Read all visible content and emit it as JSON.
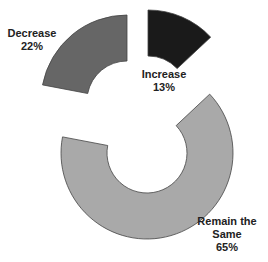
{
  "chart_data": {
    "type": "pie",
    "subtype": "exploded-donut",
    "title": "",
    "categories": [
      "Increase",
      "Remain the Same",
      "Decrease"
    ],
    "values": [
      13,
      65,
      22
    ],
    "unit": "%",
    "colors": [
      "#1a1a1a",
      "#a9a9a9",
      "#666666"
    ],
    "legend": "none (direct labels)",
    "labels": [
      {
        "name": "Increase",
        "value": "13%"
      },
      {
        "name": "Remain the Same",
        "value": "65%"
      },
      {
        "name": "Decrease",
        "value": "22%"
      }
    ]
  },
  "labels": {
    "increase": {
      "name": "Increase",
      "pct": "13%"
    },
    "remain": {
      "name1": "Remain the",
      "name2": "Same",
      "pct": "65%"
    },
    "decrease": {
      "name": "Decrease",
      "pct": "22%"
    }
  }
}
